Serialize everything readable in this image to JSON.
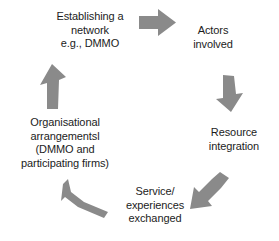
{
  "diagram": {
    "type": "cyclical-process-flow",
    "direction": "clockwise",
    "background_color": "#ffffff",
    "text_color": "#1c1c1c",
    "arrow_color": "#8a8a8a",
    "nodes": [
      {
        "id": "establishing-network",
        "label": "Establishing a\nnetwork\ne.g., DMMO",
        "position": "top-left"
      },
      {
        "id": "actors-involved",
        "label": "Actors\ninvolved",
        "position": "top-right"
      },
      {
        "id": "resource-integration",
        "label": "Resource\nintegration",
        "position": "right"
      },
      {
        "id": "service-experiences-exchanged",
        "label": "Service/\nexperiences\nexchanged",
        "position": "bottom"
      },
      {
        "id": "organisational-arrangements",
        "label": "Organisational\narrangementsl\n(DMMO and\nparticipating firms)",
        "position": "left"
      }
    ],
    "arrows": [
      {
        "id": "arrow-top-right",
        "icon": "arrow-right-icon",
        "from": "establishing-network",
        "to": "actors-involved",
        "direction": "right"
      },
      {
        "id": "arrow-right-down",
        "icon": "arrow-down-icon",
        "from": "actors-involved",
        "to": "resource-integration",
        "direction": "down"
      },
      {
        "id": "arrow-bottom-right",
        "icon": "arrow-down-left-icon",
        "from": "resource-integration",
        "to": "service-experiences-exchanged",
        "direction": "down-left"
      },
      {
        "id": "arrow-bottom-left",
        "icon": "arrow-up-left-icon",
        "from": "service-experiences-exchanged",
        "to": "organisational-arrangements",
        "direction": "up-left"
      },
      {
        "id": "arrow-left-up",
        "icon": "arrow-up-icon",
        "from": "organisational-arrangements",
        "to": "establishing-network",
        "direction": "up"
      }
    ]
  }
}
